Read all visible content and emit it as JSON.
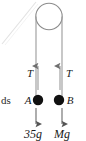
{
  "figure": {
    "type": "atwood-machine-free-body-diagram",
    "background_color": "#ffffff",
    "stroke_color": "#8c8c8c",
    "mass_fill_color": "#111111",
    "text_color": "#1a1a1a",
    "pulley": {
      "name": "pulley",
      "center_x": 49,
      "center_y": 16.5,
      "radius": 13.5
    },
    "cut_text": {
      "label": "ds"
    },
    "tension_left": {
      "label": "T",
      "direction": "up"
    },
    "tension_right": {
      "label": "T",
      "direction": "up"
    },
    "mass_left": {
      "label": "A",
      "weight_label": "35g",
      "weight_direction": "down"
    },
    "mass_right": {
      "label": "B",
      "weight_label": "Mg",
      "weight_direction": "down"
    }
  }
}
